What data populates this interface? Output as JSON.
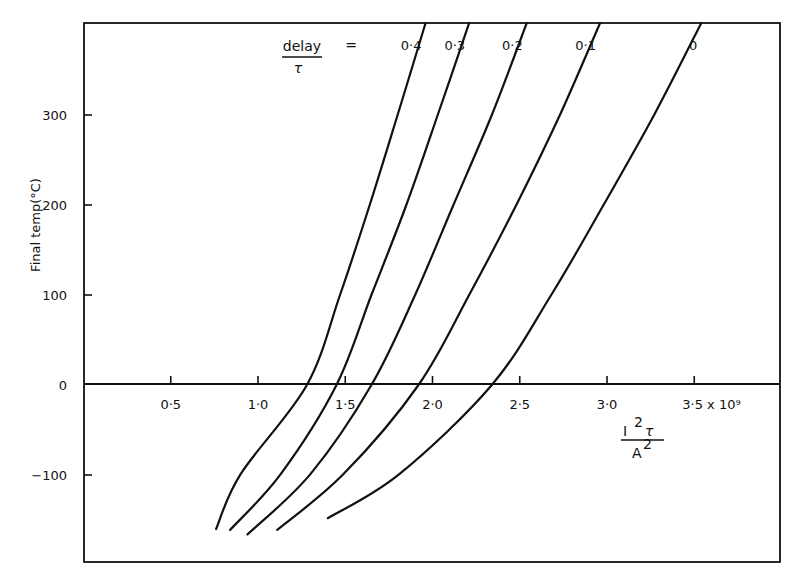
{
  "chart_data": {
    "type": "line",
    "title": "",
    "xlabel": "I²τ / A²",
    "xlabel_numerator": "I²τ",
    "xlabel_denominator": "A²",
    "x_unit_suffix": "x 10⁹",
    "ylabel": "Final temp(°C)",
    "xlim": [
      0,
      3.98
    ],
    "ylim": [
      -198,
      402
    ],
    "grid": false,
    "x_ticks": [
      0.5,
      1.0,
      1.5,
      2.0,
      2.5,
      3.0,
      3.5
    ],
    "x_tick_labels": [
      "0·5",
      "1·0",
      "1·5",
      "2·0",
      "2·5",
      "3·0",
      "3·5 x 10⁹"
    ],
    "y_ticks": [
      300,
      200,
      100,
      0,
      -100
    ],
    "y_tick_labels": [
      "300",
      "200",
      "100",
      "0",
      "−100"
    ],
    "legend_title_numerator": "delay",
    "legend_title_denominator": "τ",
    "legend_equals": "=",
    "legend_position": "top, inline with curve ends",
    "series": [
      {
        "name": "0·4",
        "x": [
          0.76,
          0.9,
          1.28,
          1.47,
          1.64,
          1.8,
          1.96
        ],
        "y": [
          -160,
          -99,
          0,
          100,
          200,
          300,
          402
        ]
      },
      {
        "name": "0·3",
        "x": [
          0.84,
          1.13,
          1.45,
          1.65,
          1.85,
          2.03,
          2.21
        ],
        "y": [
          -161,
          -99,
          0,
          100,
          200,
          300,
          402
        ]
      },
      {
        "name": "0·2",
        "x": [
          0.94,
          1.3,
          1.65,
          1.9,
          2.12,
          2.34,
          2.54
        ],
        "y": [
          -166,
          -99,
          0,
          100,
          200,
          300,
          402
        ]
      },
      {
        "name": "0·1",
        "x": [
          1.11,
          1.49,
          1.92,
          2.21,
          2.48,
          2.73,
          2.96
        ],
        "y": [
          -161,
          -99,
          0,
          100,
          200,
          300,
          402
        ]
      },
      {
        "name": "0",
        "x": [
          1.4,
          1.81,
          2.34,
          2.68,
          2.98,
          3.27,
          3.54
        ],
        "y": [
          -148,
          -99,
          0,
          100,
          200,
          300,
          402
        ]
      }
    ]
  },
  "labels": {
    "ylabel": "Final temp(°C)",
    "legend_numerator": "delay",
    "legend_denominator": "τ",
    "legend_equals": "=",
    "x_numerator_base": "I",
    "x_numerator_exp": "2",
    "x_numerator_tau": "τ",
    "x_denominator_base": "A",
    "x_denominator_exp": "2"
  }
}
